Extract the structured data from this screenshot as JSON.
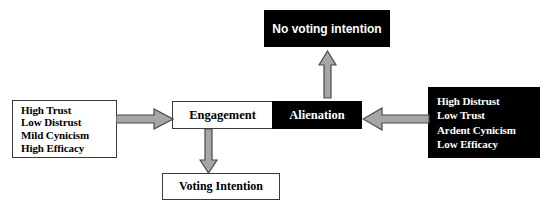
{
  "diagram": {
    "colors": {
      "fill_black": "#000000",
      "fill_white": "#ffffff",
      "text_on_black": "#ffffff",
      "text_on_white": "#000000",
      "border": "#3a3a3a",
      "arrow_fill": "#a6a6a6",
      "arrow_stroke": "#4a4a4a"
    },
    "nodes": {
      "left_antecedents": {
        "name": "left-antecedents-box",
        "style": "outline",
        "lines": [
          "High Trust",
          "Low Distrust",
          "Mild Cynicism",
          "High Efficacy"
        ]
      },
      "right_antecedents": {
        "name": "right-antecedents-box",
        "style": "filled",
        "lines": [
          "High Distrust",
          "Low Trust",
          "Ardent Cynicism",
          "Low Efficacy"
        ]
      },
      "engagement": {
        "name": "engagement-box",
        "style": "outline",
        "label": "Engagement"
      },
      "alienation": {
        "name": "alienation-box",
        "style": "filled",
        "label": "Alienation"
      },
      "voting_intention": {
        "name": "voting-intention-box",
        "style": "outline",
        "label": "Voting Intention"
      },
      "no_voting_intention": {
        "name": "no-voting-intention-box",
        "style": "filled",
        "label": "No voting intention"
      }
    },
    "arrows": [
      {
        "name": "arrow-left-antecedents-to-engagement",
        "direction": "right",
        "from": "left_antecedents",
        "to": "engagement"
      },
      {
        "name": "arrow-right-antecedents-to-alienation",
        "direction": "left",
        "from": "right_antecedents",
        "to": "alienation"
      },
      {
        "name": "arrow-alienation-to-no-voting-intention",
        "direction": "up",
        "from": "alienation",
        "to": "no_voting_intention"
      },
      {
        "name": "arrow-engagement-to-voting-intention",
        "direction": "down",
        "from": "engagement",
        "to": "voting_intention"
      }
    ]
  }
}
